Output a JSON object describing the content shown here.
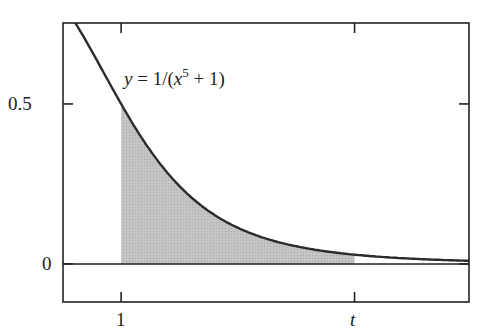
{
  "chart_data": {
    "type": "area",
    "title": "",
    "function_label": {
      "y": "y",
      "eq": " = 1/(",
      "x": "x",
      "exp": "5",
      "tail": " + 1)"
    },
    "xlabel": "",
    "ylabel": "",
    "x_ticks": [
      {
        "value": 1,
        "label": "1"
      },
      {
        "value": 2.02,
        "label": "t"
      }
    ],
    "y_ticks": [
      {
        "value": 0,
        "label": "0"
      },
      {
        "value": 0.5,
        "label": "0.5"
      }
    ],
    "xlim": [
      0.746,
      2.52
    ],
    "ylim": [
      -0.119,
      0.753
    ],
    "shaded_region": {
      "from": 1,
      "to": 2.02,
      "description": "area under curve from x=1 to x=t"
    },
    "curve": {
      "formula": "1/(x^5+1)",
      "samples": [
        [
          0.8,
          0.753
        ],
        [
          1.0,
          0.5
        ],
        [
          1.2,
          0.287
        ],
        [
          1.32,
          0.2
        ],
        [
          1.5,
          0.116
        ],
        [
          1.75,
          0.058
        ],
        [
          2.0,
          0.03
        ],
        [
          2.25,
          0.017
        ],
        [
          2.52,
          0.01
        ]
      ]
    },
    "grid": false,
    "legend": null
  },
  "colors": {
    "curve": "#2b2b2b",
    "fill": "#bdbdbd",
    "axis": "#222222"
  }
}
